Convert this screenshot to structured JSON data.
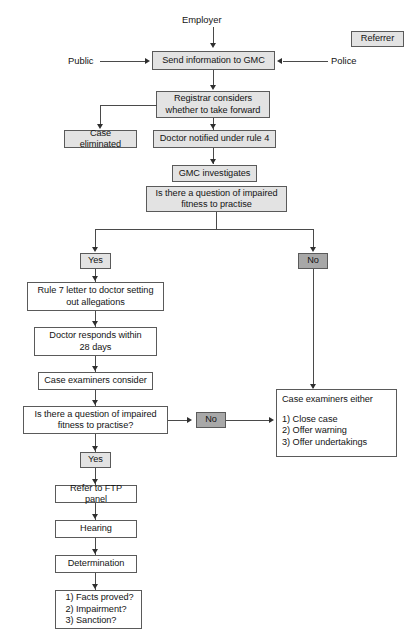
{
  "figure": {
    "type": "flowchart",
    "caption": "",
    "colors": {
      "node_fill_light": "#e3e3e3",
      "node_fill_white": "#ffffff",
      "node_fill_dark": "#a8a8a8",
      "border": "#5a5a5a",
      "connector": "#4a4a4a",
      "text": "#141414",
      "background": "#ffffff"
    }
  },
  "labels": {
    "employer": "Employer",
    "public": "Public",
    "police": "Police"
  },
  "nodes": {
    "referrer": "Referrer",
    "send_information": "Send information to GMC",
    "registrar_considers": "Registrar considers\nwhether to take forward",
    "case_eliminated": "Case eliminated",
    "doctor_notified": "Doctor notified under rule 4",
    "gmc_investigates": "GMC investigates",
    "question_impaired_1": "Is there a question of impaired\nfitness to practise",
    "yes_1": "Yes",
    "no_1": "No",
    "rule7_letter": "Rule 7 letter to doctor setting\nout allegations",
    "doctor_responds": "Doctor responds within\n28 days",
    "case_examiners_consider": "Case examiners consider",
    "question_impaired_2": "Is there a question of impaired\nfitness to practise?",
    "no_2": "No",
    "yes_2": "Yes",
    "case_examiners_either": "Case examiners either",
    "case_examiners_options": "1) Close case\n2) Offer warning\n3) Offer undertakings",
    "refer_ftp": "Refer to FTP panel",
    "hearing": "Hearing",
    "determination": "Determination",
    "panel_questions": "1) Facts proved?\n2) Impairment?\n3) Sanction?"
  }
}
